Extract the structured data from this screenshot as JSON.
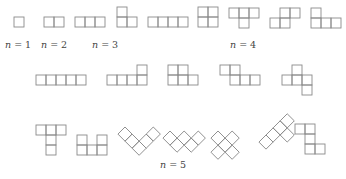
{
  "cell_size": 10,
  "labels": [
    {
      "text_var": "n",
      "text_rest": " = 1",
      "x": 5,
      "y": 48
    },
    {
      "text_var": "n",
      "text_rest": " = 2",
      "x": 41,
      "y": 48
    },
    {
      "text_var": "n",
      "text_rest": " = 3",
      "x": 92,
      "y": 48
    },
    {
      "text_var": "n",
      "text_rest": " = 4",
      "x": 230,
      "y": 48
    },
    {
      "text_var": "n",
      "text_rest": " = 5",
      "x": 160,
      "y": 168
    }
  ],
  "groups": [
    {
      "n": 1,
      "shapes": [
        {
          "name": "monomino",
          "origin": [
            14,
            17
          ],
          "rotate": 0,
          "cells": [
            [
              0,
              0
            ]
          ]
        }
      ]
    },
    {
      "n": 2,
      "shapes": [
        {
          "name": "domino",
          "origin": [
            44,
            17
          ],
          "rotate": 0,
          "cells": [
            [
              0,
              0
            ],
            [
              1,
              0
            ]
          ]
        }
      ]
    },
    {
      "n": 3,
      "shapes": [
        {
          "name": "tromino-I",
          "origin": [
            75,
            17
          ],
          "rotate": 0,
          "cells": [
            [
              0,
              0
            ],
            [
              1,
              0
            ],
            [
              2,
              0
            ]
          ]
        },
        {
          "name": "tromino-L",
          "origin": [
            117,
            7
          ],
          "rotate": 0,
          "cells": [
            [
              0,
              0
            ],
            [
              0,
              1
            ],
            [
              1,
              1
            ]
          ]
        }
      ]
    },
    {
      "n": 4,
      "shapes": [
        {
          "name": "tetromino-I",
          "origin": [
            148,
            17
          ],
          "rotate": 0,
          "cells": [
            [
              0,
              0
            ],
            [
              1,
              0
            ],
            [
              2,
              0
            ],
            [
              3,
              0
            ]
          ]
        },
        {
          "name": "tetromino-O",
          "origin": [
            198,
            7
          ],
          "rotate": 0,
          "cells": [
            [
              0,
              0
            ],
            [
              1,
              0
            ],
            [
              0,
              1
            ],
            [
              1,
              1
            ]
          ]
        },
        {
          "name": "tetromino-T",
          "origin": [
            229,
            8
          ],
          "rotate": 0,
          "cells": [
            [
              0,
              0
            ],
            [
              1,
              0
            ],
            [
              2,
              0
            ],
            [
              1,
              1
            ]
          ]
        },
        {
          "name": "tetromino-S",
          "origin": [
            270,
            8
          ],
          "rotate": 0,
          "cells": [
            [
              1,
              0
            ],
            [
              2,
              0
            ],
            [
              0,
              1
            ],
            [
              1,
              1
            ]
          ]
        },
        {
          "name": "tetromino-L",
          "origin": [
            311,
            8
          ],
          "rotate": 0,
          "cells": [
            [
              0,
              0
            ],
            [
              0,
              1
            ],
            [
              1,
              1
            ],
            [
              2,
              1
            ]
          ]
        }
      ]
    },
    {
      "n": 5,
      "shapes": [
        {
          "name": "pentomino-I",
          "origin": [
            36,
            75
          ],
          "rotate": 0,
          "cells": [
            [
              0,
              0
            ],
            [
              1,
              0
            ],
            [
              2,
              0
            ],
            [
              3,
              0
            ],
            [
              4,
              0
            ]
          ]
        },
        {
          "name": "pentomino-L",
          "origin": [
            107,
            65
          ],
          "rotate": 0,
          "cells": [
            [
              3,
              0
            ],
            [
              0,
              1
            ],
            [
              1,
              1
            ],
            [
              2,
              1
            ],
            [
              3,
              1
            ]
          ]
        },
        {
          "name": "pentomino-P",
          "origin": [
            168,
            65
          ],
          "rotate": 0,
          "cells": [
            [
              0,
              0
            ],
            [
              1,
              0
            ],
            [
              0,
              1
            ],
            [
              1,
              1
            ],
            [
              2,
              1
            ]
          ]
        },
        {
          "name": "pentomino-N",
          "origin": [
            220,
            65
          ],
          "rotate": 0,
          "cells": [
            [
              0,
              0
            ],
            [
              1,
              0
            ],
            [
              1,
              1
            ],
            [
              2,
              1
            ],
            [
              3,
              1
            ]
          ]
        },
        {
          "name": "pentomino-F",
          "origin": [
            282,
            65
          ],
          "rotate": 0,
          "cells": [
            [
              1,
              0
            ],
            [
              0,
              1
            ],
            [
              1,
              1
            ],
            [
              2,
              1
            ],
            [
              2,
              2
            ]
          ]
        },
        {
          "name": "pentomino-T",
          "origin": [
            36,
            125
          ],
          "rotate": 0,
          "cells": [
            [
              0,
              0
            ],
            [
              1,
              0
            ],
            [
              2,
              0
            ],
            [
              1,
              1
            ],
            [
              1,
              2
            ]
          ]
        },
        {
          "name": "pentomino-U",
          "origin": [
            77,
            135
          ],
          "rotate": 0,
          "cells": [
            [
              0,
              0
            ],
            [
              2,
              0
            ],
            [
              0,
              1
            ],
            [
              1,
              1
            ],
            [
              2,
              1
            ]
          ]
        },
        {
          "name": "pentomino-V",
          "origin": [
            125,
            127
          ],
          "rotate": 45,
          "cells": [
            [
              0,
              0
            ],
            [
              1,
              0
            ],
            [
              2,
              0
            ],
            [
              2,
              -1
            ],
            [
              2,
              -2
            ]
          ]
        },
        {
          "name": "pentomino-W",
          "origin": [
            170,
            131
          ],
          "rotate": 45,
          "cells": [
            [
              0,
              0
            ],
            [
              1,
              0
            ],
            [
              1,
              -1
            ],
            [
              2,
              -1
            ],
            [
              2,
              -2
            ]
          ]
        },
        {
          "name": "pentomino-X",
          "origin": [
            218,
            131
          ],
          "rotate": 45,
          "cells": [
            [
              1,
              -1
            ],
            [
              0,
              0
            ],
            [
              1,
              0
            ],
            [
              2,
              0
            ],
            [
              1,
              1
            ]
          ]
        },
        {
          "name": "pentomino-Y",
          "origin": [
            266,
            135
          ],
          "rotate": 45,
          "cells": [
            [
              0,
              0
            ],
            [
              0,
              -1
            ],
            [
              0,
              -2
            ],
            [
              0,
              -3
            ],
            [
              1,
              -2
            ]
          ]
        },
        {
          "name": "pentomino-Z",
          "origin": [
            295,
            124
          ],
          "rotate": 0,
          "cells": [
            [
              0,
              0
            ],
            [
              1,
              0
            ],
            [
              1,
              1
            ],
            [
              1,
              2
            ],
            [
              2,
              2
            ]
          ]
        }
      ]
    }
  ]
}
